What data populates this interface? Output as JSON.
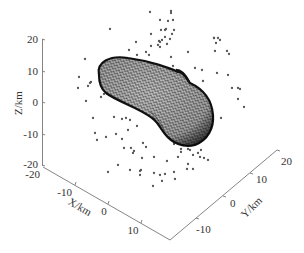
{
  "chart_data": {
    "type": "scatter",
    "title": "",
    "axes": {
      "x": {
        "label": "X/km",
        "ticks": [
          "-20",
          "-10",
          "0",
          "10"
        ],
        "range": [
          -20,
          15
        ]
      },
      "y": {
        "label": "Y/km",
        "ticks": [
          "-10",
          "0",
          "10",
          "20"
        ],
        "range": [
          -15,
          20
        ]
      },
      "z": {
        "label": "Z/km",
        "ticks": [
          "20",
          "10",
          "0",
          "-10",
          "-20"
        ],
        "range": [
          -20,
          20
        ]
      }
    },
    "series": [
      {
        "name": "mesh-surface",
        "kind": "triangular-mesh",
        "color": "#1a1a1a"
      },
      {
        "name": "scatter-points",
        "kind": "points",
        "color": "#555555",
        "count": 110
      }
    ],
    "grid": false,
    "legend": null
  },
  "labels": {
    "x_axis": "X/km",
    "y_axis": "Y/km",
    "z_axis": "Z/km",
    "z_ticks": [
      "20",
      "10",
      "0",
      "-10",
      "-20"
    ],
    "x_ticks": [
      "-20",
      "-10",
      "0",
      "10"
    ],
    "y_ticks": [
      "-10",
      "0",
      "10",
      "20"
    ]
  }
}
